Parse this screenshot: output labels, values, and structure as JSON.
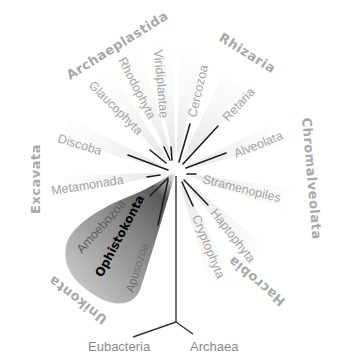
{
  "diagram": {
    "type": "unrooted-phylogenetic-tree",
    "supergroups": [
      {
        "name": "Archaeplastida",
        "clades": [
          "Glaucophyta",
          "Rhodophyta",
          "Viridiplantae"
        ]
      },
      {
        "name": "Rhizaria",
        "clades": [
          "Cercozoa",
          "Retaria"
        ]
      },
      {
        "name": "Chromalveolata",
        "clades": [
          "Alveolata",
          "Stramenopiles"
        ]
      },
      {
        "name": "Hacrobia",
        "clades": [
          "Haptophyta",
          "Cryptophyta"
        ]
      },
      {
        "name": "Unikonta",
        "clades": [
          "Amoebozoa",
          "Ophistokonta",
          "Apusozoa"
        ]
      },
      {
        "name": "Excavata",
        "clades": [
          "Discoba",
          "Metamonada"
        ]
      }
    ],
    "highlighted_clade": "Ophistokonta",
    "root": {
      "left": "Eubacteria",
      "right": "Archaea"
    }
  },
  "labels": {
    "archaeplastida": "Archaeplastida",
    "rhizaria": "Rhizaria",
    "chromalveolata": "Chromalveolata",
    "hacrobia": "Hacrobia",
    "unikonta": "Unikonta",
    "excavata": "Excavata",
    "glaucophyta": "Glaucophyta",
    "rhodophyta": "Rhodophyta",
    "viridiplantae": "Viridiplantae",
    "cercozoa": "Cercozoa",
    "retaria": "Retaria",
    "alveolata": "Alveolata",
    "stramenopiles": "Stramenopiles",
    "haptophyta": "Haptophyta",
    "cryptophyta": "Cryptophyta",
    "amoebozoa": "Amoebozoa",
    "ophistokonta": "Ophistokonta",
    "apusozoa": "Apusozoa",
    "discoba": "Discoba",
    "metamonada": "Metamonada",
    "eubacteria": "Eubacteria",
    "archaea": "Archaea"
  },
  "colors": {
    "label_gray": "#a3a3a3",
    "branch": "#1e1e1e",
    "highlight_dark": "#3a3a3a",
    "highlight_light": "#d8d8d8",
    "ophistokonta_text": "#000000"
  }
}
